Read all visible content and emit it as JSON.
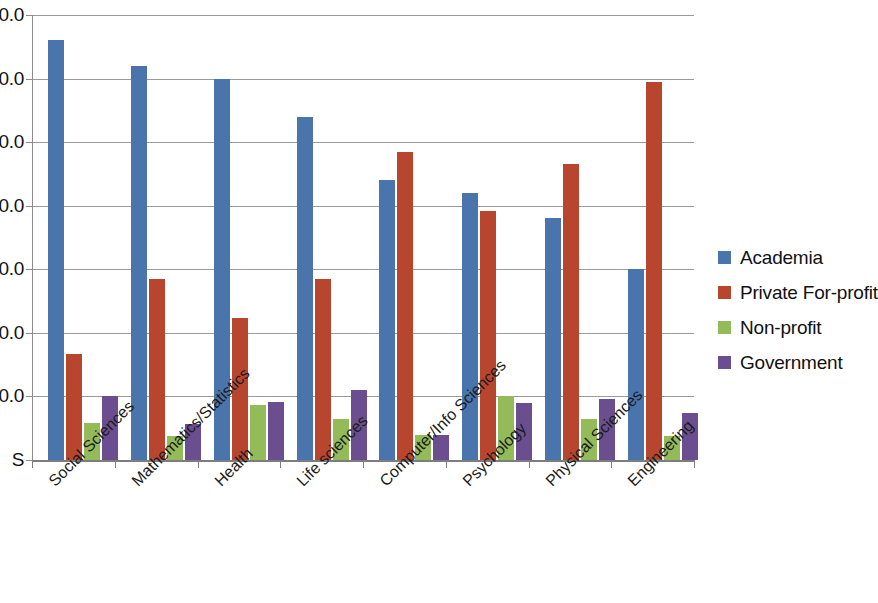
{
  "chart_data": {
    "type": "bar",
    "title": "",
    "xlabel": "",
    "ylabel": "",
    "ylim": [
      0,
      70
    ],
    "grid": true,
    "legend_position": "right",
    "categories": [
      "Social Sciences",
      "Mathematics/Statistics",
      "Health",
      "Life sciences",
      "Computer/Info Sciences",
      "Psychology",
      "Physical Sciences",
      "Engineering"
    ],
    "y_tick_labels": [
      "70.0",
      "60.0",
      "50.0",
      "40.0",
      "30.0",
      "20.0",
      "10.0",
      "S"
    ],
    "y_tick_values": [
      70,
      60,
      50,
      40,
      30,
      20,
      10,
      0
    ],
    "series": [
      {
        "name": "Academia",
        "color": "#4a74ac",
        "values": [
          66.0,
          62.0,
          60.0,
          54.0,
          44.0,
          42.0,
          38.0,
          30.0
        ]
      },
      {
        "name": "Private For-profit",
        "color": "#b8462f",
        "values": [
          16.7,
          28.5,
          22.3,
          28.4,
          48.5,
          39.2,
          46.5,
          59.5
        ]
      },
      {
        "name": "Non-profit",
        "color": "#93bb59",
        "values": [
          5.8,
          3.8,
          8.7,
          6.5,
          3.9,
          10.1,
          6.4,
          3.8
        ]
      },
      {
        "name": "Government",
        "color": "#6b4e8f",
        "values": [
          10.0,
          5.6,
          9.2,
          11.0,
          4.0,
          9.0,
          9.6,
          7.4
        ]
      }
    ]
  },
  "legend": {
    "items": [
      {
        "label": "Academia",
        "color": "#4a74ac"
      },
      {
        "label": "Private For-profit",
        "color": "#b8462f"
      },
      {
        "label": "Non-profit",
        "color": "#93bb59"
      },
      {
        "label": "Government",
        "color": "#6b4e8f"
      }
    ]
  }
}
